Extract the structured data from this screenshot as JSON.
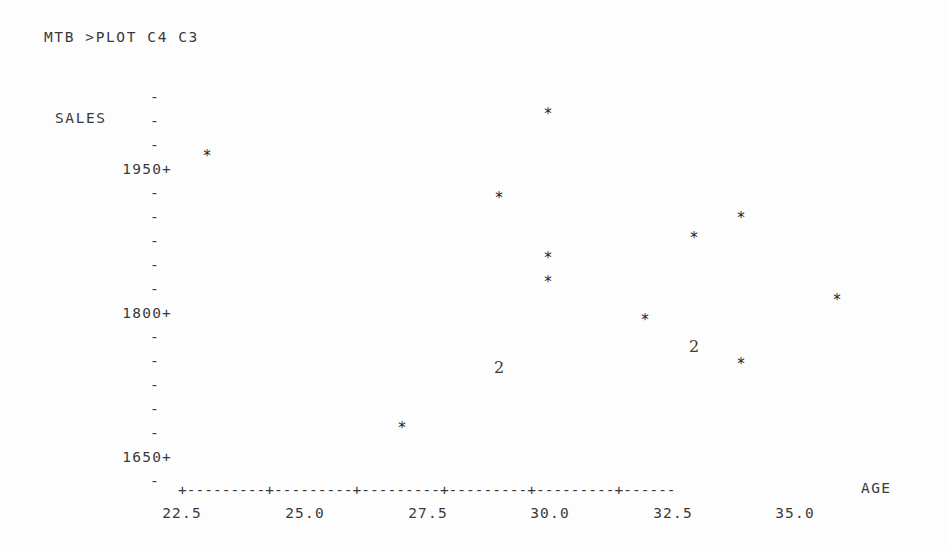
{
  "terminal": {
    "prompt": "MTB >",
    "command": "PLOT C4 C3",
    "command_line": "MTB >PLOT C4 C3"
  },
  "axes": {
    "y_title": "SALES",
    "x_title": "AGE",
    "y_tick_labels": [
      "1950+",
      "1800+",
      "1650+"
    ],
    "y_minor_glyph": "-",
    "x_tick_labels": [
      "22.5",
      "25.0",
      "27.5",
      "30.0",
      "32.5",
      "35.0"
    ],
    "x_axis_rule": "+---------+---------+---------+---------+---------+------",
    "x_tick_glyph": "+"
  },
  "chart_data": {
    "type": "scatter",
    "title": "",
    "xlabel": "AGE",
    "ylabel": "SALES",
    "xlim": [
      22.5,
      37.0
    ],
    "ylim": [
      1575,
      2070
    ],
    "grid": false,
    "legend": null,
    "marker_glyph": "*",
    "overplot_note": "A digit replaces the asterisk where that many observations coincide",
    "x_ticks": [
      22.5,
      25.0,
      27.5,
      30.0,
      32.5,
      35.0
    ],
    "y_ticks": [
      1650,
      1800,
      1950
    ],
    "points": [
      {
        "x": 23.0,
        "y": 1989,
        "count": 1,
        "glyph": "*",
        "px": 207,
        "py": 156
      },
      {
        "x": 27.0,
        "y": 1597,
        "count": 1,
        "glyph": "*",
        "px": 402,
        "py": 428
      },
      {
        "x": 29.0,
        "y": 1928,
        "count": 1,
        "glyph": "*",
        "px": 499,
        "py": 198
      },
      {
        "x": 29.0,
        "y": 1683,
        "count": 2,
        "glyph": "2",
        "px": 499,
        "py": 368
      },
      {
        "x": 30.0,
        "y": 2050,
        "count": 1,
        "glyph": "*",
        "px": 548,
        "py": 114
      },
      {
        "x": 30.0,
        "y": 1842,
        "count": 1,
        "glyph": "*",
        "px": 548,
        "py": 258
      },
      {
        "x": 30.0,
        "y": 1808,
        "count": 1,
        "glyph": "*",
        "px": 548,
        "py": 282
      },
      {
        "x": 32.0,
        "y": 1753,
        "count": 1,
        "glyph": "*",
        "px": 645,
        "py": 320
      },
      {
        "x": 33.0,
        "y": 1871,
        "count": 1,
        "glyph": "*",
        "px": 694,
        "py": 238
      },
      {
        "x": 33.0,
        "y": 1713,
        "count": 2,
        "glyph": "2",
        "px": 694,
        "py": 347
      },
      {
        "x": 34.0,
        "y": 1900,
        "count": 1,
        "glyph": "*",
        "px": 741,
        "py": 218
      },
      {
        "x": 34.0,
        "y": 1689,
        "count": 1,
        "glyph": "*",
        "px": 741,
        "py": 364
      },
      {
        "x": 36.0,
        "y": 1781,
        "count": 1,
        "glyph": "*",
        "px": 837,
        "py": 300
      }
    ]
  },
  "layout": {
    "y_axis_top_px": 97,
    "y_tick_step_px": 24,
    "y_tick_rows": 17,
    "y_labeled_rows": [
      3,
      9,
      15
    ],
    "x_tick_px": [
      182,
      305,
      428,
      550,
      673,
      795
    ],
    "colors": {
      "ink": "#2b2b2b",
      "paper": "#fdfdfd"
    }
  }
}
